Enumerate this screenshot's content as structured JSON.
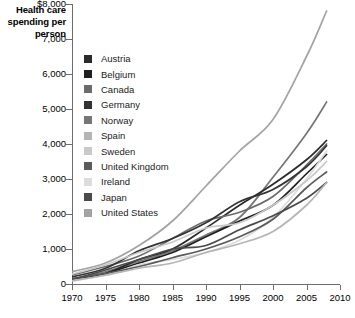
{
  "chart_title": "Health care spending per person",
  "axes": {
    "y_ticks": [
      "$8,000",
      "7,000",
      "6,000",
      "5,000",
      "4,000",
      "3,000",
      "2,000",
      "1,000",
      "0"
    ],
    "x_ticks": [
      "1970",
      "1975",
      "1980",
      "1985",
      "1990",
      "1995",
      "2000",
      "2005",
      "2010"
    ]
  },
  "legend": {
    "items": [
      {
        "label": "Austria",
        "color": "#2b2b2b"
      },
      {
        "label": "Belgium",
        "color": "#1f1f1f"
      },
      {
        "label": "Canada",
        "color": "#6b6b6b"
      },
      {
        "label": "Germany",
        "color": "#333333"
      },
      {
        "label": "Norway",
        "color": "#767676"
      },
      {
        "label": "Spain",
        "color": "#b5b5b5"
      },
      {
        "label": "Sweden",
        "color": "#c9c9c9"
      },
      {
        "label": "United Kingdom",
        "color": "#5a5a5a"
      },
      {
        "label": "Ireland",
        "color": "#dcdcdc"
      },
      {
        "label": "Japan",
        "color": "#4a4a4a"
      },
      {
        "label": "United States",
        "color": "#a3a3a3"
      }
    ]
  },
  "chart_data": {
    "type": "line",
    "title": "Health care spending per person",
    "xlabel": "",
    "ylabel": "Health care spending per person",
    "xlim": [
      1970,
      2010
    ],
    "ylim": [
      0,
      8000
    ],
    "grid": false,
    "legend_position": "inside-top-left",
    "y_tick_values": [
      0,
      1000,
      2000,
      3000,
      4000,
      5000,
      6000,
      7000,
      8000
    ],
    "x_tick_values": [
      1970,
      1975,
      1980,
      1985,
      1990,
      1995,
      2000,
      2005,
      2010
    ],
    "x": [
      1970,
      1975,
      1980,
      1985,
      1990,
      1995,
      2000,
      2005,
      2008
    ],
    "series": [
      {
        "name": "United States",
        "color": "#a3a3a3",
        "values": [
          350,
          600,
          1100,
          1800,
          2800,
          3800,
          4700,
          6500,
          7800
        ]
      },
      {
        "name": "Norway",
        "color": "#767676",
        "values": [
          140,
          350,
          650,
          950,
          1400,
          1900,
          3050,
          4300,
          5200
        ]
      },
      {
        "name": "Austria",
        "color": "#2b2b2b",
        "values": [
          120,
          300,
          700,
          1000,
          1600,
          2250,
          2850,
          3550,
          4100
        ]
      },
      {
        "name": "Canada",
        "color": "#6b6b6b",
        "values": [
          260,
          500,
          800,
          1300,
          1800,
          2050,
          2500,
          3400,
          4000
        ]
      },
      {
        "name": "Germany",
        "color": "#333333",
        "values": [
          200,
          450,
          950,
          1300,
          1750,
          2350,
          2700,
          3350,
          3950
        ]
      },
      {
        "name": "Belgium",
        "color": "#1f1f1f",
        "values": [
          120,
          300,
          600,
          900,
          1350,
          1800,
          2250,
          3150,
          3700
        ]
      },
      {
        "name": "Ireland",
        "color": "#dcdcdc",
        "values": [
          100,
          250,
          550,
          700,
          900,
          1250,
          1900,
          3000,
          3800
        ]
      },
      {
        "name": "United Kingdom",
        "color": "#5a5a5a",
        "values": [
          150,
          300,
          500,
          750,
          1000,
          1350,
          1850,
          2750,
          3200
        ]
      },
      {
        "name": "Sweden",
        "color": "#c9c9c9",
        "values": [
          280,
          550,
          900,
          1200,
          1600,
          1750,
          2250,
          2950,
          3500
        ]
      },
      {
        "name": "Japan",
        "color": "#4a4a4a",
        "values": [
          130,
          400,
          700,
          1000,
          1100,
          1550,
          1950,
          2450,
          2900
        ]
      },
      {
        "name": "Spain",
        "color": "#b5b5b5",
        "values": [
          90,
          250,
          450,
          600,
          900,
          1150,
          1500,
          2250,
          2900
        ]
      }
    ]
  }
}
